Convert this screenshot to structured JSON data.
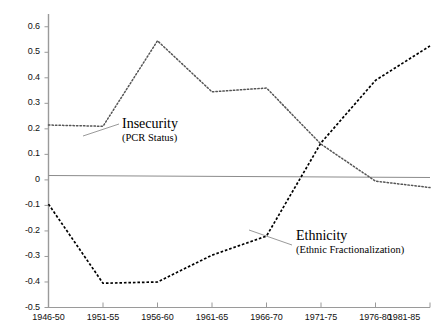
{
  "chart_data": {
    "type": "line",
    "title": "",
    "subtitle": "",
    "xlabel": "",
    "ylabel": "",
    "categories": [
      "1946-50",
      "1951-55",
      "1956-60",
      "1961-65",
      "1966-70",
      "1971-75",
      "1976-80",
      "1981-85"
    ],
    "ylim": [
      -0.5,
      0.65
    ],
    "yticks": [
      0.6,
      0.5,
      0.4,
      0.3,
      0.2,
      0.1,
      0,
      -0.1,
      -0.2,
      -0.3,
      -0.4,
      -0.5
    ],
    "ytick_labels": [
      "0.6",
      "0.5",
      "0.4",
      "0.3",
      "0.2",
      "0.1",
      "0",
      "-0.1",
      "-0.2",
      "-0.3",
      "-0.4",
      "-0.5"
    ],
    "grid": false,
    "legend": "inline-annotations",
    "zero_line": true,
    "series": [
      {
        "name": "Insecurity",
        "sublabel": "(PCR Status)",
        "style": "dotted",
        "color": "#555555",
        "values": [
          0.215,
          0.21,
          0.545,
          0.345,
          0.36,
          0.14,
          -0.005,
          -0.03
        ],
        "midpoints": [
          0.2125,
          0.3775,
          0.445,
          0.3525,
          0.25,
          0.0675,
          -0.0175
        ]
      },
      {
        "name": "Ethnicity",
        "sublabel": "(Ethnic Fractionalization)",
        "style": "dashed",
        "color": "#000000",
        "values": [
          -0.095,
          -0.405,
          -0.4,
          -0.295,
          -0.22,
          0.145,
          0.39,
          0.525
        ],
        "midpoints": [
          -0.25,
          -0.4025,
          -0.3475,
          -0.2575,
          -0.0375,
          0.2675,
          0.4575
        ]
      }
    ],
    "annotations": [
      {
        "id": "insecurity",
        "title": "Insecurity",
        "sub": "(PCR Status)",
        "leader_from_x": 83,
        "leader_from_y": 136,
        "leader_to_x": 119,
        "leader_to_y": 124
      },
      {
        "id": "ethnicity",
        "title": "Ethnicity",
        "sub": "(Ethnic Fractionalization)",
        "leader_from_x": 249,
        "leader_from_y": 230,
        "leader_to_x": 292,
        "leader_to_y": 245
      }
    ]
  },
  "axes": {
    "y_tick_labels": [
      "0.6",
      "0.5",
      "0.4",
      "0.3",
      "0.2",
      "0.1",
      "0",
      "-0.1",
      "-0.2",
      "-0.3",
      "-0.4",
      "-0.5"
    ],
    "x_tick_labels": [
      "1946-50",
      "1951-55",
      "1956-60",
      "1961-65",
      "1966-70",
      "1971-75",
      "1976-80",
      "1981-85"
    ]
  },
  "colors": {
    "axis": "#9a9a9a",
    "zero_line": "#8c8c8c",
    "series_insecurity": "#555555",
    "series_ethnicity": "#000000",
    "text": "#111111",
    "background": "#ffffff"
  }
}
